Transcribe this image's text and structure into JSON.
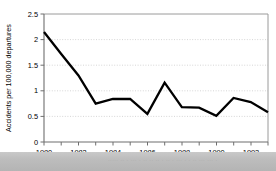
{
  "figure": {
    "background_color": "#ffffff",
    "plot_border_color": "#808080",
    "line_color": "#000000",
    "gridline_color": "#cccccc"
  },
  "bottom_band": {
    "label": "bottom-strip",
    "color": "#bdbdbd",
    "faint_text": "..... .. . ... . .. .. .. . .. . ... . . .. ... ... ."
  },
  "chart_data": {
    "type": "line",
    "title": "",
    "xlabel": "",
    "ylabel": "Accidents per 100,000 departures",
    "xlim": [
      1980,
      1993
    ],
    "ylim": [
      0,
      2.5
    ],
    "grid": true,
    "grid_axis": "y",
    "legend": false,
    "x": [
      1980,
      1981,
      1982,
      1983,
      1984,
      1985,
      1986,
      1987,
      1988,
      1989,
      1990,
      1991,
      1992,
      1993
    ],
    "values": [
      2.15,
      1.72,
      1.3,
      0.75,
      0.84,
      0.84,
      0.55,
      1.16,
      0.68,
      0.67,
      0.51,
      0.86,
      0.78,
      0.58
    ],
    "series": [
      {
        "name": "Accidents per 100,000 departures",
        "values": [
          2.15,
          1.72,
          1.3,
          0.75,
          0.84,
          0.84,
          0.55,
          1.16,
          0.68,
          0.67,
          0.51,
          0.86,
          0.78,
          0.58
        ]
      }
    ],
    "y_ticks": [
      0,
      0.5,
      1,
      1.5,
      2,
      2.5
    ],
    "y_tick_labels": [
      "0",
      "0.5",
      "1",
      "1.5",
      "2",
      "2.5"
    ],
    "x_ticks": [
      1980,
      1981,
      1982,
      1983,
      1984,
      1985,
      1986,
      1987,
      1988,
      1989,
      1990,
      1991,
      1992,
      1993
    ],
    "x_tick_labels": [
      "1980",
      "",
      "1982",
      "",
      "1984",
      "",
      "1986",
      "",
      "1988",
      "",
      "1990",
      "",
      "1992",
      ""
    ],
    "x_labeled_ticks": [
      {
        "year": 1980,
        "label": "1980"
      },
      {
        "year": 1982,
        "label": "1982"
      },
      {
        "year": 1984,
        "label": "1984"
      },
      {
        "year": 1986,
        "label": "1986"
      },
      {
        "year": 1988,
        "label": "1988"
      },
      {
        "year": 1990,
        "label": "1990"
      },
      {
        "year": 1992,
        "label": "1992"
      }
    ]
  }
}
